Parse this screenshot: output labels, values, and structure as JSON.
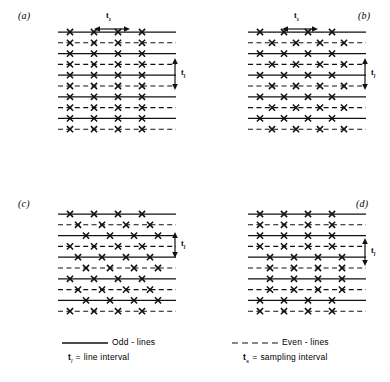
{
  "figure": {
    "panels": [
      {
        "id": "a",
        "label": "(a)",
        "label_pos": {
          "x": 18,
          "y": 10
        },
        "lattice_pos": {
          "x": 58,
          "y": 28
        },
        "lattice_size": {
          "w": 108,
          "h": 100
        },
        "n_lines": 10,
        "line_spacing": 10.8,
        "sample_interval": 24,
        "first_sample_x": 12,
        "n_samples": 4,
        "offsets": [
          0,
          0,
          0,
          0,
          0,
          0,
          0,
          0,
          0,
          0
        ],
        "show_ts": true,
        "show_tl": true,
        "ts_pos": {
          "x": 100,
          "y": 14
        },
        "ts_span_start": 94,
        "ts_span_end": 130,
        "tl_pos": {
          "x": 170,
          "y": 57
        },
        "tl_top": 58,
        "tl_bottom": 90
      },
      {
        "id": "b",
        "label": "(b)",
        "label_pos": {
          "x": 358,
          "y": 10
        },
        "lattice_pos": {
          "x": 248,
          "y": 28
        },
        "lattice_size": {
          "w": 108,
          "h": 100
        },
        "n_lines": 10,
        "line_spacing": 10.8,
        "sample_interval": 24,
        "first_sample_x": 12,
        "n_samples": 4,
        "offsets": [
          0,
          12,
          0,
          12,
          0,
          12,
          0,
          12,
          0,
          12
        ],
        "show_ts": true,
        "show_tl": true,
        "ts_pos": {
          "x": 288,
          "y": 14
        },
        "ts_span_start": 282,
        "ts_span_end": 318,
        "tl_pos": {
          "x": 360,
          "y": 57
        },
        "tl_top": 58,
        "tl_bottom": 90
      },
      {
        "id": "c",
        "label": "(c)",
        "label_pos": {
          "x": 18,
          "y": 198
        },
        "lattice_pos": {
          "x": 58,
          "y": 210
        },
        "lattice_size": {
          "w": 108,
          "h": 100
        },
        "n_lines": 10,
        "line_spacing": 10.8,
        "sample_interval": 24,
        "first_sample_x": 12,
        "n_samples": 4,
        "offsets": [
          0,
          8,
          16,
          0,
          8,
          16,
          0,
          8,
          16,
          0
        ],
        "show_ts": false,
        "show_tl": true,
        "tl_pos": {
          "x": 170,
          "y": 232
        },
        "tl_top": 232,
        "tl_bottom": 258
      },
      {
        "id": "d",
        "label": "(d)",
        "label_pos": {
          "x": 356,
          "y": 198
        },
        "lattice_pos": {
          "x": 248,
          "y": 210
        },
        "lattice_size": {
          "w": 108,
          "h": 100
        },
        "n_lines": 10,
        "line_spacing": 10.8,
        "sample_interval": 24,
        "first_sample_x": 12,
        "n_samples": 4,
        "offsets": [
          0,
          0,
          0,
          0,
          10,
          10,
          10,
          10,
          0,
          0
        ],
        "show_ts": false,
        "show_tl": true,
        "tl_pos": {
          "x": 360,
          "y": 238
        },
        "tl_top": 238,
        "tl_bottom": 266
      }
    ],
    "annotations": {
      "ts_label": "t",
      "ts_subscript": "s",
      "tl_label": "t",
      "tl_subscript": "l"
    },
    "legend": {
      "odd": {
        "style": "solid",
        "text": "Odd - lines",
        "pos": {
          "x": 62,
          "y": 333
        }
      },
      "even": {
        "style": "dashed",
        "text": "Even - lines",
        "pos": {
          "x": 232,
          "y": 333
        }
      },
      "line_interval": {
        "symbol": "t",
        "subscript": "l",
        "equals": "=",
        "text": "line interval",
        "pos": {
          "x": 68,
          "y": 352
        }
      },
      "sampling_interval": {
        "symbol": "t",
        "subscript": "s",
        "equals": "=",
        "text": "sampling interval",
        "pos": {
          "x": 243,
          "y": 352
        }
      }
    },
    "colors": {
      "ink": "#111111",
      "background": "#ffffff"
    }
  }
}
